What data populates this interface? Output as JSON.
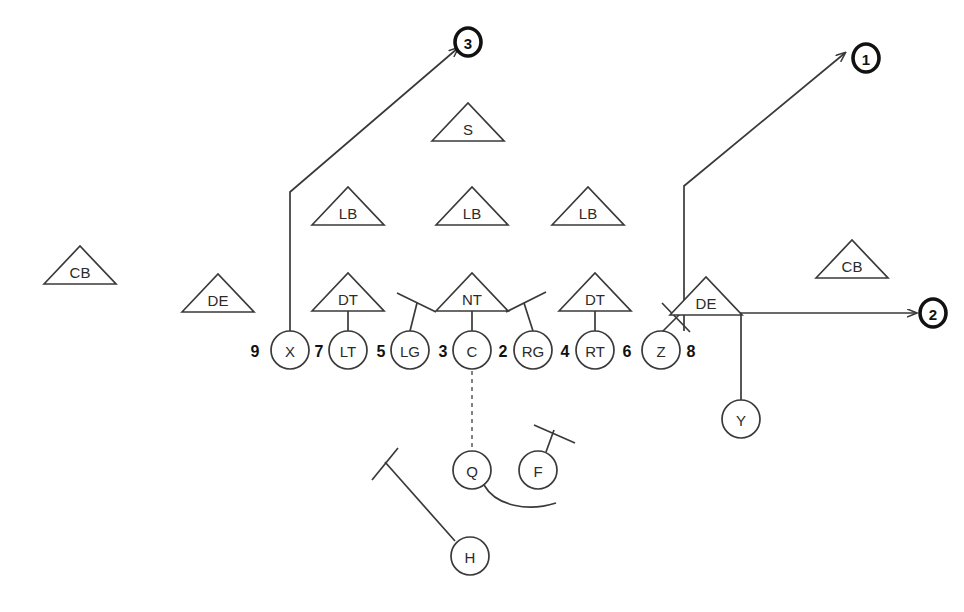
{
  "diagram": {
    "type": "offensive-play-with-defensive-front",
    "background_color": "#ffffff",
    "line_color": "#3a3a3a",
    "marker_color": "#111111"
  },
  "offense": {
    "shape": "circle",
    "players": [
      {
        "label": "X",
        "cx": 290,
        "cy": 350,
        "r": 19,
        "name": "offense-x-receiver"
      },
      {
        "label": "LT",
        "cx": 348,
        "cy": 350,
        "r": 19,
        "name": "offense-left-tackle"
      },
      {
        "label": "LG",
        "cx": 410,
        "cy": 350,
        "r": 19,
        "name": "offense-left-guard"
      },
      {
        "label": "C",
        "cx": 472,
        "cy": 350,
        "r": 19,
        "name": "offense-center"
      },
      {
        "label": "RG",
        "cx": 533,
        "cy": 350,
        "r": 19,
        "name": "offense-right-guard"
      },
      {
        "label": "RT",
        "cx": 595,
        "cy": 350,
        "r": 19,
        "name": "offense-right-tackle"
      },
      {
        "label": "Z",
        "cx": 661,
        "cy": 350,
        "r": 19,
        "name": "offense-z-receiver"
      },
      {
        "label": "Y",
        "cx": 741,
        "cy": 419,
        "r": 19,
        "name": "offense-y-receiver"
      },
      {
        "label": "Q",
        "cx": 472,
        "cy": 470,
        "r": 19,
        "name": "offense-quarterback"
      },
      {
        "label": "F",
        "cx": 538,
        "cy": 470,
        "r": 19,
        "name": "offense-fullback"
      },
      {
        "label": "H",
        "cx": 470,
        "cy": 556,
        "r": 19,
        "name": "offense-h-back"
      }
    ]
  },
  "defense": {
    "shape": "triangle",
    "players": [
      {
        "label": "CB",
        "cx": 80,
        "cy": 265,
        "name": "defense-cornerback-left"
      },
      {
        "label": "DE",
        "cx": 218,
        "cy": 293,
        "name": "defense-end-left"
      },
      {
        "label": "DT",
        "cx": 348,
        "cy": 292,
        "name": "defense-tackle-left"
      },
      {
        "label": "NT",
        "cx": 472,
        "cy": 292,
        "name": "defense-nose-tackle"
      },
      {
        "label": "DT",
        "cx": 595,
        "cy": 292,
        "name": "defense-tackle-right"
      },
      {
        "label": "DE",
        "cx": 706,
        "cy": 296,
        "name": "defense-end-right"
      },
      {
        "label": "CB",
        "cx": 852,
        "cy": 259,
        "name": "defense-cornerback-right"
      },
      {
        "label": "LB",
        "cx": 348,
        "cy": 206,
        "name": "defense-linebacker-left"
      },
      {
        "label": "LB",
        "cx": 472,
        "cy": 206,
        "name": "defense-linebacker-middle"
      },
      {
        "label": "LB",
        "cx": 588,
        "cy": 206,
        "name": "defense-linebacker-right"
      },
      {
        "label": "S",
        "cx": 468,
        "cy": 122,
        "name": "defense-safety"
      }
    ]
  },
  "gap_numbers": [
    {
      "label": "9",
      "x": 255,
      "y": 350,
      "name": "gap-number-9"
    },
    {
      "label": "7",
      "x": 319,
      "y": 350,
      "name": "gap-number-7"
    },
    {
      "label": "5",
      "x": 381,
      "y": 350,
      "name": "gap-number-5"
    },
    {
      "label": "3",
      "x": 443,
      "y": 350,
      "name": "gap-number-3"
    },
    {
      "label": "2",
      "x": 503,
      "y": 350,
      "name": "gap-number-2"
    },
    {
      "label": "4",
      "x": 565,
      "y": 350,
      "name": "gap-number-4"
    },
    {
      "label": "6",
      "x": 627,
      "y": 350,
      "name": "gap-number-6"
    },
    {
      "label": "8",
      "x": 691,
      "y": 350,
      "name": "gap-number-8"
    }
  ],
  "route_markers": [
    {
      "label": "1",
      "cx": 866,
      "cy": 58,
      "rx": 13,
      "ry": 14,
      "name": "route-marker-1"
    },
    {
      "label": "3",
      "cx": 468,
      "cy": 42,
      "rx": 13,
      "ry": 14,
      "name": "route-marker-3"
    },
    {
      "label": "2",
      "cx": 933,
      "cy": 313,
      "rx": 13,
      "ry": 14,
      "name": "route-marker-2"
    }
  ],
  "routes": [
    {
      "name": "route-x-to-marker-3",
      "path": "M 290 331 L 290 192 L 458 48",
      "arrow": true
    },
    {
      "name": "route-z-to-marker-1",
      "path": "M 684 331 L 684 186 L 845 53",
      "arrow": true
    },
    {
      "name": "route-y-to-marker-2",
      "path": "M 741 400 L 741 313 L 916 313",
      "arrow": true
    }
  ],
  "blocks": [
    {
      "name": "block-lt-on-dt",
      "path": "M 348 331 L 348 309 M 327 309 L 369 309"
    },
    {
      "name": "block-c-on-nt",
      "path": "M 472 331 L 472 309 M 451 309 L 493 309"
    },
    {
      "name": "block-rt-on-dt",
      "path": "M 595 331 L 595 309 M 574 309 L 616 309"
    },
    {
      "name": "block-lg-angled",
      "path": "M 410 331 L 417 303 M 397 293 L 436 312"
    },
    {
      "name": "block-rg-angled",
      "path": "M 533 331 L 524 303 M 506 312 L 546 292"
    },
    {
      "name": "block-f-angled",
      "path": "M 546 452 L 554 430 M 534 425 L 575 443"
    },
    {
      "name": "block-h-angled",
      "path": "M 455 541 L 385 462 M 372 480 L 398 448"
    }
  ],
  "crack_block": {
    "name": "crack-block-z-on-de",
    "path": "M 660 334 L 689 305 M 662 303 L 690 332"
  },
  "snap": {
    "name": "snap-line-center-to-qb",
    "path": "M 472 371 L 472 449"
  },
  "qb_motion": {
    "name": "qb-motion-path",
    "path": "M 484 485 C 496 506, 528 512, 556 503"
  }
}
